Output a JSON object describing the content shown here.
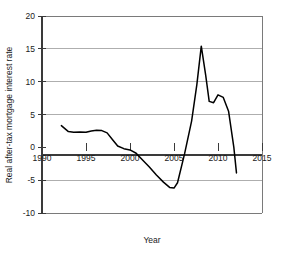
{
  "chart_data": {
    "type": "line",
    "title": "",
    "xlabel": "Year",
    "ylabel": "Real after-tax mortgage interest rate",
    "xlim": [
      1990,
      2015
    ],
    "ylim": [
      -10,
      20
    ],
    "xticks": [
      1990,
      1995,
      2000,
      2005,
      2010,
      2015
    ],
    "yticks": [
      -10,
      -5,
      0,
      5,
      10,
      15,
      20
    ],
    "xtick_labels": [
      "1990",
      "1995",
      "2000",
      "2005",
      "2010",
      "2015"
    ],
    "ytick_labels": [
      "-10",
      "-5",
      "0",
      "5",
      "10",
      "15",
      "20"
    ],
    "grid": true,
    "grid_axis": "y",
    "legend": false,
    "line_color": "#000000",
    "series": [
      {
        "name": "Real after-tax mortgage interest rate",
        "x": [
          1992.2,
          1993.0,
          1993.6,
          1994.3,
          1995.0,
          1995.6,
          1996.2,
          1996.8,
          1997.4,
          1998.0,
          1998.6,
          1999.3,
          2000.0,
          2000.7,
          2001.4,
          2002.2,
          2003.0,
          2003.8,
          2004.5,
          2005.0,
          2005.4,
          2006.2,
          2007.0,
          2007.6,
          2008.1,
          2008.6,
          2009.0,
          2009.5,
          2010.0,
          2010.6,
          2011.2,
          2011.8,
          2012.1
        ],
        "y": [
          3.3,
          2.4,
          2.3,
          2.35,
          2.3,
          2.5,
          2.6,
          2.55,
          2.2,
          1.2,
          0.2,
          -0.2,
          -0.4,
          -0.9,
          -1.9,
          -3.0,
          -4.2,
          -5.3,
          -6.1,
          -6.2,
          -5.4,
          -1.0,
          4.0,
          9.6,
          15.4,
          11.0,
          7.0,
          6.8,
          8.0,
          7.6,
          5.5,
          0.0,
          -3.9
        ]
      }
    ]
  },
  "axis_labels": {
    "y_title": "Real after-tax mortgage interest rate",
    "x_title": "Year"
  }
}
